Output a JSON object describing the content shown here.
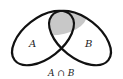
{
  "diagram": {
    "type": "venn",
    "sets": [
      {
        "name": "A",
        "label": "A"
      },
      {
        "name": "B",
        "label": "B"
      }
    ],
    "intersection": {
      "label": "A ∩ B",
      "fill": "#c8c8c8"
    },
    "stroke_color": "#111111",
    "background": "#ffffff"
  }
}
